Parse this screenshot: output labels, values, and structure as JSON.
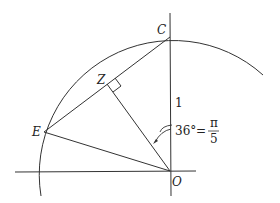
{
  "diagram": {
    "type": "geometry",
    "points": {
      "O": {
        "label": "O",
        "x": 170,
        "y": 171
      },
      "C": {
        "label": "C",
        "x": 170,
        "y": 37
      },
      "E": {
        "label": "E",
        "x": 44,
        "y": 132
      },
      "Z": {
        "label": "Z",
        "x": 107,
        "y": 84
      }
    },
    "labels": {
      "radius": "1",
      "angle_deg": "36°",
      "equals": "=",
      "pi": "π",
      "five": "5"
    },
    "colors": {
      "stroke": "#333333",
      "background": "#ffffff"
    }
  }
}
